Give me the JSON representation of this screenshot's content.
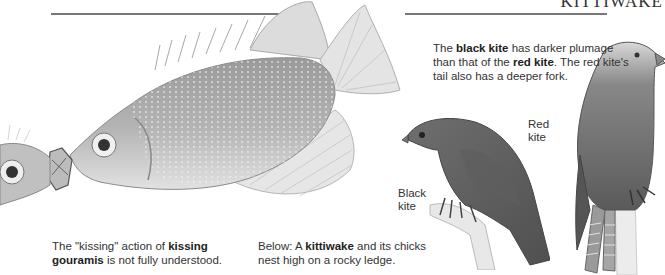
{
  "page": {
    "running_head": "KITTIWAKE"
  },
  "captions": {
    "kites": {
      "parts": [
        "The ",
        "black kite",
        " has darker plumage than that of the ",
        "red kite",
        ". The red kite's tail also has a deeper fork."
      ]
    },
    "gouramis": {
      "parts": [
        "The \"kissing\" action of ",
        "kissing gouramis",
        " is not fully understood."
      ]
    },
    "kittiwake": {
      "parts": [
        "Below: A ",
        "kittiwake",
        " and its chicks nest high on a rocky ledge."
      ]
    }
  },
  "labels": {
    "red_kite": [
      "Red",
      "kite"
    ],
    "black_kite": [
      "Black",
      "kite"
    ]
  },
  "illustrations": {
    "fish": "kissing-gouramis-illustration",
    "black_kite": "black-kite-illustration",
    "red_kite": "red-kite-illustration"
  }
}
